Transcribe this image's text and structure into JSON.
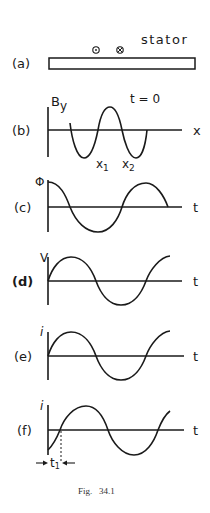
{
  "figure": {
    "caption": "Fig.   34.1",
    "colors": {
      "ink": "#1a1a1a",
      "background": "#ffffff"
    }
  },
  "panels": {
    "a": {
      "label": "(a)",
      "title": "stator",
      "symbols": [
        "⊙",
        "⊗"
      ],
      "symbol_names": [
        "current-out-of-page-icon",
        "current-into-page-icon"
      ]
    },
    "b": {
      "label": "(b)",
      "y_axis": "B",
      "y_axis_sub": "y",
      "x_axis": "x",
      "annotation": "t = 0",
      "markers": [
        "x",
        "x"
      ],
      "marker_subs": [
        "1",
        "2"
      ]
    },
    "c": {
      "label": "(c)",
      "y_axis": "Φ",
      "x_axis": "t"
    },
    "d": {
      "label": "(d)",
      "y_axis": "V",
      "x_axis": "t"
    },
    "e": {
      "label": "(e)",
      "y_axis": "i",
      "x_axis": "t"
    },
    "f": {
      "label": "(f)",
      "y_axis": "i",
      "x_axis": "t",
      "interval": "t",
      "interval_sub": "1"
    }
  }
}
